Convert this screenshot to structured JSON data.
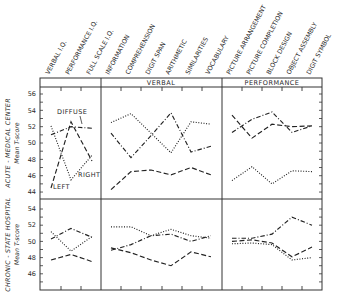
{
  "chart_data": {
    "type": "line",
    "title": "",
    "columns": [
      "VERBAL I.Q.",
      "PERFORMANCE I.Q.",
      "FULL SCALE I.Q.",
      "INFORMATION",
      "COMPREHENSION",
      "DIGIT SPAN",
      "ARITHMETIC",
      "SIMILARITIES",
      "VOCABULARY",
      "PICTURE ARRANGEMENT",
      "PICTURE COMPLETION",
      "BLOCK DESIGN",
      "OBJECT ASSEMBLY",
      "DIGIT SYMBOL"
    ],
    "column_groups": [
      {
        "label": "",
        "columns": [
          "VERBAL I.Q.",
          "PERFORMANCE I.Q.",
          "FULL SCALE I.Q."
        ]
      },
      {
        "label": "VERBAL",
        "columns": [
          "INFORMATION",
          "COMPREHENSION",
          "DIGIT SPAN",
          "ARITHMETIC",
          "SIMILARITIES",
          "VOCABULARY"
        ]
      },
      {
        "label": "PERFORMANCE",
        "columns": [
          "PICTURE ARRANGEMENT",
          "PICTURE COMPLETION",
          "BLOCK DESIGN",
          "OBJECT ASSEMBLY",
          "DIGIT SYMBOL"
        ]
      }
    ],
    "legend": [
      {
        "name": "LEFT",
        "style": "dashed"
      },
      {
        "name": "RIGHT",
        "style": "dotted"
      },
      {
        "name": "DIFFUSE",
        "style": "dash-dot"
      }
    ],
    "panels": [
      {
        "ylabel": "ACUTE - MEDICAL CENTER\nMean T-score",
        "ylabel_line1": "ACUTE - MEDICAL CENTER",
        "ylabel_line2": "Mean T-score",
        "yticks": [
          44,
          46,
          48,
          50,
          52,
          54,
          56
        ],
        "ylim": [
          43,
          57
        ],
        "series": [
          {
            "name": "LEFT",
            "style": "dashed",
            "values": [
              44.5,
              52.6,
              47.8,
              44.3,
              46.5,
              46.7,
              46.1,
              47.0,
              46.1,
              53.4,
              50.6,
              52.3,
              52.0,
              52.1
            ]
          },
          {
            "name": "RIGHT",
            "style": "dotted",
            "values": [
              52.1,
              45.5,
              48.5,
              52.5,
              53.6,
              51.2,
              48.8,
              52.6,
              52.3,
              45.4,
              47.1,
              45.0,
              46.6,
              46.5
            ]
          },
          {
            "name": "DIFFUSE",
            "style": "dash-dot",
            "values": [
              51.0,
              52.0,
              51.8,
              51.2,
              48.2,
              50.9,
              53.7,
              48.9,
              49.6,
              51.3,
              52.9,
              53.8,
              51.3,
              52.1
            ]
          }
        ],
        "annotations": [
          {
            "text": "DIFFUSE"
          },
          {
            "text": "LEFT"
          },
          {
            "text": "RIGHT"
          }
        ]
      },
      {
        "ylabel": "CHRONIC - STATE HOSPITAL\nMean T-score",
        "ylabel_line1": "CHRONIC - STATE HOSPITAL",
        "ylabel_line2": "Mean T-score",
        "yticks": [
          46,
          48,
          50,
          52,
          54
        ],
        "ylim": [
          44.5,
          55.3
        ],
        "series": [
          {
            "name": "LEFT",
            "style": "dashed",
            "values": [
              47.7,
              48.4,
              47.5,
              49.2,
              48.6,
              47.7,
              47.0,
              48.7,
              48.1,
              50.0,
              50.2,
              49.8,
              48.1,
              49.3
            ]
          },
          {
            "name": "RIGHT",
            "style": "dotted",
            "values": [
              51.2,
              48.8,
              50.6,
              51.8,
              51.8,
              50.7,
              51.5,
              50.7,
              50.4,
              49.7,
              49.8,
              49.6,
              47.7,
              48.0
            ]
          },
          {
            "name": "DIFFUSE",
            "style": "dash-dot",
            "values": [
              50.3,
              51.6,
              50.5,
              48.9,
              49.6,
              50.7,
              50.9,
              50.0,
              50.7,
              50.4,
              50.4,
              50.9,
              53.0,
              52.0
            ]
          }
        ]
      }
    ],
    "grid": false,
    "legend_position": "inline annotations in top-left panel"
  }
}
